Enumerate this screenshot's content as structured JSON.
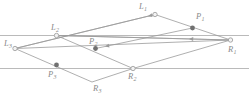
{
  "figure": {
    "width": 249,
    "height": 104,
    "background_color": "#ffffff",
    "line_color": "#9a9a9a",
    "rail_color": "#a8a8a8",
    "label_color": "#8a8a8a",
    "open_node_fill": "#f2f2f2",
    "open_node_stroke": "#999999",
    "filled_node_fill": "#707070"
  },
  "rails": [
    {
      "name": "upper-parallel-line",
      "y": 35.5,
      "x1": 0,
      "x2": 249
    },
    {
      "name": "lower-parallel-line",
      "y": 68.5,
      "x1": 0,
      "x2": 249
    }
  ],
  "nodes": [
    {
      "id": "L1",
      "label": "L",
      "sub": "1",
      "x": 155.0,
      "y": 14.5,
      "style": "open",
      "label_x": 139.0,
      "label_y": 2.0
    },
    {
      "id": "L2",
      "label": "L",
      "sub": "2",
      "x": 56.5,
      "y": 35.5,
      "style": "open",
      "label_x": 51.0,
      "label_y": 22.5
    },
    {
      "id": "L3",
      "label": "L",
      "sub": "3",
      "x": 15.0,
      "y": 48.5,
      "style": "open",
      "label_x": 4.0,
      "label_y": 39.0
    },
    {
      "id": "R1",
      "label": "R",
      "sub": "1",
      "x": 230.5,
      "y": 40.0,
      "style": "open",
      "label_x": 228.0,
      "label_y": 45.0
    },
    {
      "id": "R2",
      "label": "R",
      "sub": "2",
      "x": 133.0,
      "y": 68.5,
      "style": "open",
      "label_x": 128.0,
      "label_y": 72.0
    },
    {
      "id": "R3",
      "label": "R",
      "sub": "3",
      "x": 92.0,
      "y": 82.0,
      "style": "none",
      "label_x": 93.0,
      "label_y": 84.0
    },
    {
      "id": "P1",
      "label": "P",
      "sub": "1",
      "x": 192.5,
      "y": 28.0,
      "style": "filled",
      "label_x": 196.0,
      "label_y": 12.0
    },
    {
      "id": "P2",
      "label": "P",
      "sub": "2",
      "x": 95.5,
      "y": 48.5,
      "style": "filled",
      "label_x": 89.0,
      "label_y": 37.0
    },
    {
      "id": "P3",
      "label": "P",
      "sub": "3",
      "x": 56.5,
      "y": 65.0,
      "style": "filled",
      "label_x": 48.0,
      "label_y": 70.0
    }
  ],
  "segments": [
    {
      "name": "L3-L1",
      "x1": 15.0,
      "y1": 48.5,
      "x2": 155.0,
      "y2": 14.5
    },
    {
      "name": "L1-R1",
      "x1": 155.0,
      "y1": 14.5,
      "x2": 230.5,
      "y2": 40.0
    },
    {
      "name": "L3-R3",
      "x1": 15.0,
      "y1": 48.5,
      "x2": 92.0,
      "y2": 82.0
    },
    {
      "name": "R3-R2",
      "x1": 92.0,
      "y1": 82.0,
      "x2": 133.0,
      "y2": 68.5
    },
    {
      "name": "R2-R1",
      "x1": 133.0,
      "y1": 68.5,
      "x2": 230.5,
      "y2": 40.0
    },
    {
      "name": "L2-R2",
      "x1": 56.5,
      "y1": 35.5,
      "x2": 133.0,
      "y2": 68.5
    },
    {
      "name": "L2-R1",
      "x1": 56.5,
      "y1": 35.5,
      "x2": 230.5,
      "y2": 40.0
    },
    {
      "name": "L3-R1-long",
      "x1": 15.0,
      "y1": 48.5,
      "x2": 230.5,
      "y2": 40.0
    }
  ],
  "arrow_segments": [
    {
      "name": "arrow-L1-to-L3",
      "x1": 155.0,
      "y1": 14.5,
      "x2": 15.0,
      "y2": 48.5,
      "head_x": 148.0,
      "head_y": 16.2
    },
    {
      "name": "arrow-R1-to-L2",
      "x1": 230.5,
      "y1": 40.0,
      "x2": 56.5,
      "y2": 35.5,
      "head_x": 189.0,
      "head_y": 38.9
    },
    {
      "name": "arrow-P1-to-P2",
      "x1": 192.5,
      "y1": 28.0,
      "x2": 95.5,
      "y2": 48.5,
      "head_x": 105.0,
      "head_y": 46.5
    }
  ]
}
